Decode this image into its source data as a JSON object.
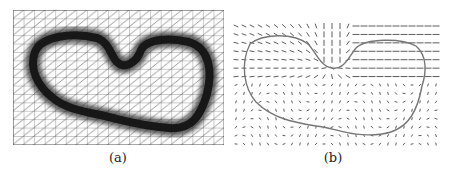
{
  "figure": {
    "panels": [
      {
        "id": "a",
        "caption": "(a)",
        "description": "Triangulated mesh grid with a dark, heavily refined band along a closed heart-like contour",
        "colors": {
          "mesh": "#555555",
          "band": "#1c1c1c",
          "background": "#ffffff"
        }
      },
      {
        "id": "b",
        "caption": "(b)",
        "description": "Vector (arrow) field with overlaid closed contour curve",
        "colors": {
          "arrows": "#333333",
          "contour": "#777777",
          "background": "#ffffff"
        }
      }
    ]
  }
}
